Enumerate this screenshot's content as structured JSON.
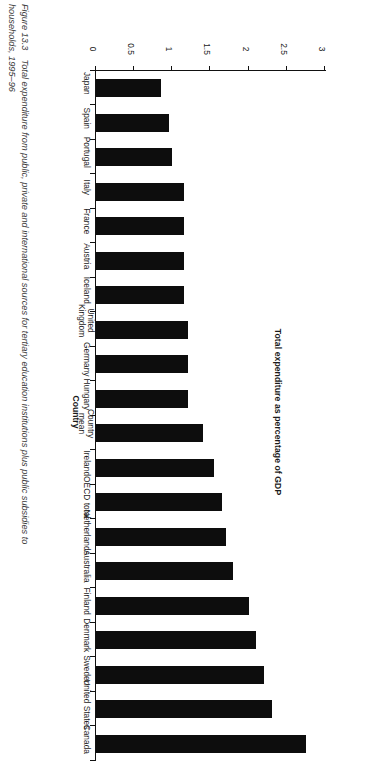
{
  "figure": {
    "number": "Figure 13.3",
    "caption_line1": "Total expenditure from public, private and international sources for tertiary education institutions plus public subsidies to",
    "caption_line2": "households, 1995–96"
  },
  "chart_data": {
    "type": "bar",
    "orientation": "horizontal",
    "title": "",
    "xlabel": "Country",
    "ylabel": "Total expenditure as percentage of GDP",
    "ylim": [
      0,
      3
    ],
    "ticks": [
      "0",
      "0.5",
      "1",
      "1.5",
      "2",
      "2.5",
      "3"
    ],
    "grid": false,
    "legend": false,
    "categories": [
      "Canada",
      "United States",
      "Sweden",
      "Denmark",
      "Finland",
      "Australia",
      "Netherlands",
      "OECD total",
      "Ireland",
      "Country\nmean",
      "Hungary",
      "Germany",
      "United\nKingdom",
      "Iceland",
      "Austria",
      "France",
      "Italy",
      "Portugal",
      "Spain",
      "Japan"
    ],
    "values": [
      2.75,
      2.3,
      2.2,
      2.1,
      2.0,
      1.8,
      1.7,
      1.65,
      1.55,
      1.4,
      1.2,
      1.2,
      1.2,
      1.15,
      1.15,
      1.15,
      1.15,
      1.0,
      0.95,
      0.85
    ],
    "bar_color": "#0d0d0d",
    "axis_color": "#111111"
  }
}
